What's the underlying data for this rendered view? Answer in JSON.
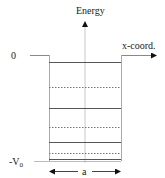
{
  "diagram": {
    "type": "finite square potential well energy level diagram",
    "axis_labels": {
      "y": "Energy",
      "x": "x-coord."
    },
    "level_labels": {
      "zero": "0",
      "bottom": "-V",
      "bottom_subscript": "0"
    },
    "width_label": "a",
    "energy_levels": [
      {
        "style": "solid",
        "y": 62
      },
      {
        "style": "dotted",
        "y": 87
      },
      {
        "style": "solid",
        "y": 108
      },
      {
        "style": "dotted",
        "y": 127
      },
      {
        "style": "solid",
        "y": 142
      },
      {
        "style": "dotted",
        "y": 153
      },
      {
        "style": "solid",
        "y": 159
      }
    ],
    "colors": {
      "line": "#555555",
      "axis": "#bbbbbb",
      "wall": "#999999",
      "text": "#222222"
    }
  }
}
